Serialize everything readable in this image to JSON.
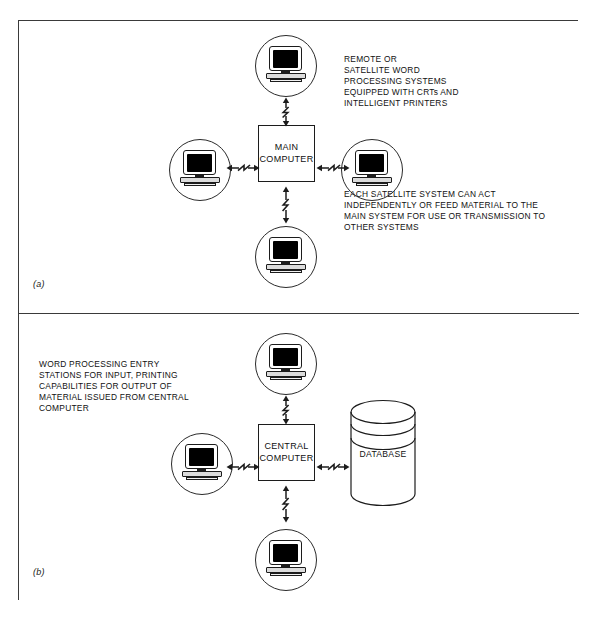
{
  "figure": {
    "panels": [
      {
        "id": "a",
        "label": "(a)",
        "center_box": "MAIN\nCOMPUTER",
        "center_box_lines": [
          "MAIN",
          "COMPUTER"
        ],
        "notes": [
          "REMOTE OR\nSATELLITE WORD\nPROCESSING SYSTEMS\nEQUIPPED WITH CRTs AND\nINTELLIGENT PRINTERS",
          "EACH SATELLITE SYSTEM CAN ACT\nINDEPENDENTLY OR FEED MATERIAL TO THE\nMAIN SYSTEM FOR USE OR TRANSMISSION TO\nOTHER SYSTEMS"
        ],
        "terminals": [
          "top-terminal",
          "left-terminal",
          "right-terminal",
          "bottom-terminal"
        ],
        "connectors": [
          "top-link",
          "left-link",
          "right-link",
          "bottom-link"
        ]
      },
      {
        "id": "b",
        "label": "(b)",
        "center_box": "CENTRAL\nCOMPUTER",
        "center_box_lines": [
          "CENTRAL",
          "COMPUTER"
        ],
        "database_label": "DATABASE",
        "notes": [
          "WORD PROCESSING ENTRY\nSTATIONS FOR INPUT, PRINTING\nCAPABILITIES FOR OUTPUT OF\nMATERIAL ISSUED FROM CENTRAL\nCOMPUTER"
        ],
        "terminals": [
          "top-terminal",
          "left-terminal",
          "bottom-terminal"
        ],
        "connectors": [
          "top-link",
          "left-link",
          "right-link",
          "bottom-link"
        ]
      }
    ]
  },
  "colors": {
    "line": "#1c1c1c",
    "frame": "#3a3a3a",
    "screen": "#000000",
    "background": "#ffffff"
  }
}
